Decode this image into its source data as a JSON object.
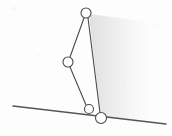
{
  "figure": {
    "canvas": {
      "width": 172,
      "height": 136
    },
    "background_color": "#fdfdfd",
    "stroke_color": "#4a4a4a",
    "joint_fill_color": "#ffffff",
    "shading_color": "#e9e9e9",
    "stroke_width": 1.1,
    "joint_radius": 5
  },
  "joints": [
    {
      "id": "top",
      "label": "top-joint",
      "x": 86,
      "y": 13,
      "r": 5
    },
    {
      "id": "mid_left",
      "label": "middle-left-joint",
      "x": 68,
      "y": 62,
      "r": 5
    },
    {
      "id": "lower_mid",
      "label": "lower-middle-joint",
      "x": 89,
      "y": 109,
      "r": 4.5
    },
    {
      "id": "ground_pivot",
      "label": "ground-pivot-joint",
      "x": 101,
      "y": 118,
      "r": 5.5
    }
  ],
  "links": [
    {
      "id": "link_top_midleft",
      "label": "upper-left-link",
      "x1": 84,
      "y1": 18,
      "x2": 70,
      "y2": 57
    },
    {
      "id": "link_midleft_lowermid",
      "label": "lower-left-link",
      "x1": 70,
      "y1": 67,
      "x2": 86,
      "y2": 105
    },
    {
      "id": "link_top_ground",
      "label": "right-coupler-link",
      "x1": 88,
      "y1": 18,
      "x2": 100,
      "y2": 113
    }
  ],
  "ground_line": {
    "label": "inclined-ground-line",
    "x1": 13,
    "y1": 106,
    "x2": 166,
    "y2": 124
  },
  "shading_region": {
    "label": "scan-shadow",
    "points": "89,14 150,22 150,120 101,118"
  }
}
